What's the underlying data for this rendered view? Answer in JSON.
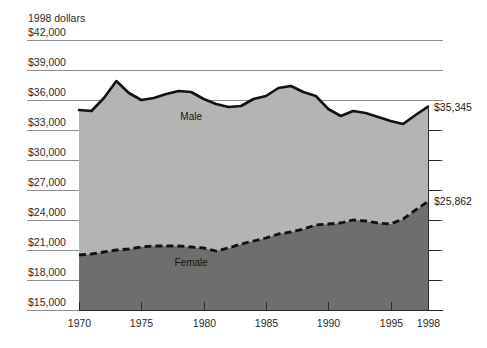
{
  "chart_data": {
    "type": "area",
    "title": "1998 dollars",
    "xlabel": "",
    "ylabel": "1998 dollars",
    "ylim": [
      15000,
      42000
    ],
    "xlim": [
      1970,
      1998
    ],
    "grid": true,
    "legend_position": "inline-annotations",
    "y_ticks": [
      "$42,000",
      "$39,000",
      "$36,000",
      "$33,000",
      "$30,000",
      "$27,000",
      "$24,000",
      "$21,000",
      "$18,000",
      "$15,000"
    ],
    "y_tick_values": [
      42000,
      39000,
      36000,
      33000,
      30000,
      27000,
      24000,
      21000,
      18000,
      15000
    ],
    "x_ticks": [
      "1970",
      "1975",
      "1980",
      "1985",
      "1990",
      "1995",
      "1998"
    ],
    "x_tick_values": [
      1970,
      1975,
      1980,
      1985,
      1990,
      1995,
      1998
    ],
    "x": [
      1970,
      1971,
      1972,
      1973,
      1974,
      1975,
      1976,
      1977,
      1978,
      1979,
      1980,
      1981,
      1982,
      1983,
      1984,
      1985,
      1986,
      1987,
      1988,
      1989,
      1990,
      1991,
      1992,
      1993,
      1994,
      1995,
      1996,
      1997,
      1998
    ],
    "series": [
      {
        "name": "Male",
        "label": "Male",
        "style": "solid",
        "fill_color": "#b4b4b4",
        "line_color": "#121212",
        "end_label": "$35,345",
        "end_value": 35345,
        "values": [
          35000,
          34900,
          36200,
          37900,
          36700,
          36000,
          36200,
          36600,
          36900,
          36800,
          36100,
          35600,
          35300,
          35400,
          36100,
          36400,
          37200,
          37400,
          36800,
          36400,
          35100,
          34400,
          34900,
          34700,
          34300,
          33900,
          33600,
          34500,
          35345
        ]
      },
      {
        "name": "Female",
        "label": "Female",
        "style": "dashed",
        "fill_color": "#6e6e6e",
        "line_color": "#121212",
        "end_label": "$25,862",
        "end_value": 25862,
        "values": [
          20500,
          20600,
          20800,
          21000,
          21100,
          21300,
          21400,
          21400,
          21400,
          21300,
          21200,
          20900,
          21200,
          21600,
          21900,
          22200,
          22600,
          22800,
          23100,
          23500,
          23600,
          23700,
          24000,
          23900,
          23700,
          23600,
          24100,
          25000,
          25862
        ]
      }
    ],
    "annotations": [
      {
        "text": "Male",
        "x": 1979,
        "y": 34000
      },
      {
        "text": "Female",
        "x": 1979,
        "y": 19400
      },
      {
        "text": "$35,345",
        "x": 1998,
        "y": 35345
      },
      {
        "text": "$25,862",
        "x": 1998,
        "y": 25862
      }
    ]
  },
  "colors": {
    "male_band": "#b4b4b4",
    "female_band": "#6e6e6e",
    "line": "#121212",
    "gridline": "#8e8e8e",
    "axis": "#2a2a2a",
    "background": "#ffffff"
  }
}
